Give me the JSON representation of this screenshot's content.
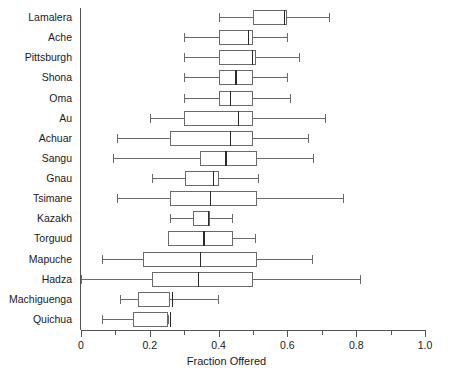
{
  "chart": {
    "type": "box",
    "title": "",
    "xlabel": "Fraction Offered",
    "ylabel": "",
    "xlim": [
      0,
      1.0
    ],
    "grid": false,
    "legend": null,
    "orientation": "horizontal",
    "x_ticks_major": [
      "0",
      "0.2",
      "0.4",
      "0.6",
      "0.8",
      "1.0"
    ],
    "x_tick_values_major": [
      0,
      0.2,
      0.4,
      0.6,
      0.8,
      1.0
    ],
    "x_tick_values_minor": [
      0.1,
      0.3,
      0.5,
      0.7,
      0.9
    ],
    "categories": [
      "Lamalera",
      "Ache",
      "Pittsburgh",
      "Shona",
      "Oma",
      "Au",
      "Achuar",
      "Sangu",
      "Gnau",
      "Tsimane",
      "Kazakh",
      "Torguud",
      "Mapuche",
      "Hadza",
      "Machiguenga",
      "Quichua"
    ],
    "boxes": [
      {
        "label": "Lamalera",
        "whisker_low": 0.4,
        "q1": 0.5,
        "median": 0.59,
        "q3": 0.6,
        "whisker_high": 0.72
      },
      {
        "label": "Ache",
        "whisker_low": 0.3,
        "q1": 0.4,
        "median": 0.485,
        "q3": 0.5,
        "whisker_high": 0.6
      },
      {
        "label": "Pittsburgh",
        "whisker_low": 0.3,
        "q1": 0.4,
        "median": 0.497,
        "q3": 0.51,
        "whisker_high": 0.633
      },
      {
        "label": "Shona",
        "whisker_low": 0.3,
        "q1": 0.4,
        "median": 0.448,
        "q3": 0.5,
        "whisker_high": 0.6
      },
      {
        "label": "Oma",
        "whisker_low": 0.3,
        "q1": 0.4,
        "median": 0.433,
        "q3": 0.5,
        "whisker_high": 0.608
      },
      {
        "label": "Au",
        "whisker_low": 0.2,
        "q1": 0.3,
        "median": 0.456,
        "q3": 0.5,
        "whisker_high": 0.709
      },
      {
        "label": "Achuar",
        "whisker_low": 0.105,
        "q1": 0.259,
        "median": 0.433,
        "q3": 0.5,
        "whisker_high": 0.66
      },
      {
        "label": "Sangu",
        "whisker_low": 0.093,
        "q1": 0.346,
        "median": 0.419,
        "q3": 0.512,
        "whisker_high": 0.674
      },
      {
        "label": "Gnau",
        "whisker_low": 0.206,
        "q1": 0.302,
        "median": 0.384,
        "q3": 0.4,
        "whisker_high": 0.515
      },
      {
        "label": "Tsimane",
        "whisker_low": 0.105,
        "q1": 0.259,
        "median": 0.375,
        "q3": 0.512,
        "whisker_high": 0.762
      },
      {
        "label": "Kazakh",
        "whisker_low": 0.259,
        "q1": 0.326,
        "median": 0.369,
        "q3": 0.375,
        "whisker_high": 0.439
      },
      {
        "label": "Torguud",
        "whisker_low": 0.253,
        "q1": 0.253,
        "median": 0.355,
        "q3": 0.442,
        "whisker_high": 0.506
      },
      {
        "label": "Mapuche",
        "whisker_low": 0.061,
        "q1": 0.18,
        "median": 0.346,
        "q3": 0.512,
        "whisker_high": 0.672
      },
      {
        "label": "Hadza",
        "whisker_low": 0.0,
        "q1": 0.206,
        "median": 0.34,
        "q3": 0.5,
        "whisker_high": 0.811
      },
      {
        "label": "Machiguenga",
        "whisker_low": 0.113,
        "q1": 0.166,
        "median": 0.264,
        "q3": 0.259,
        "whisker_high": 0.398
      },
      {
        "label": "Quichua",
        "whisker_low": 0.061,
        "q1": 0.151,
        "median": 0.259,
        "q3": 0.253,
        "whisker_high": 0.253
      }
    ]
  }
}
